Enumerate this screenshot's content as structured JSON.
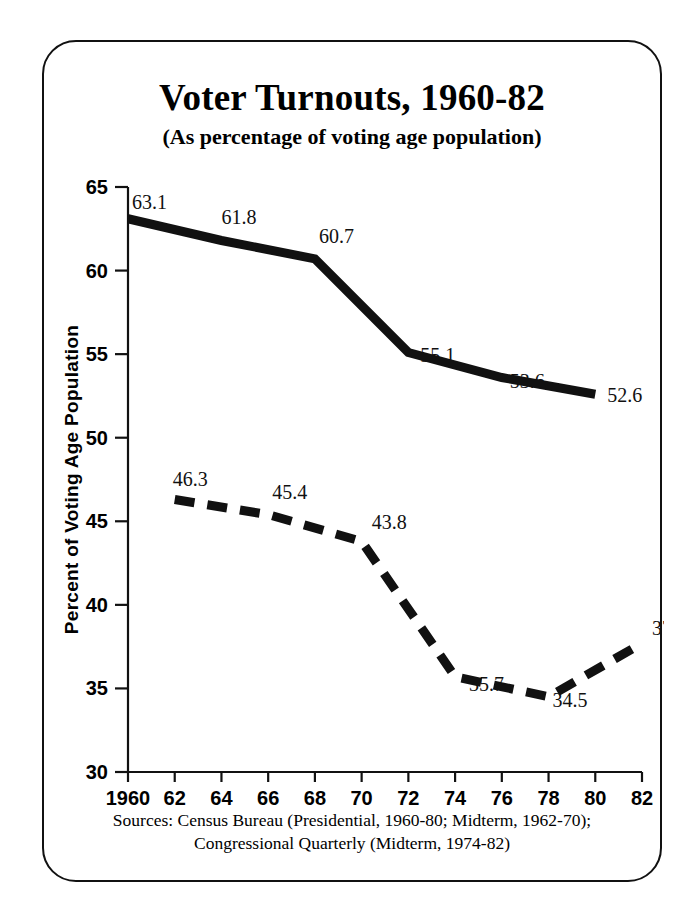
{
  "figure": {
    "title": "Voter Turnouts, 1960-82",
    "subtitle": "(As percentage of voting age population)",
    "source_line_1": "Sources: Census Bureau (Presidential, 1960-80; Midterm, 1962-70);",
    "source_line_2": "Congressional Quarterly (Midterm, 1974-82)"
  },
  "chart_data": {
    "type": "line",
    "title": "Voter Turnouts, 1960-82",
    "subtitle": "(As percentage of voting age population)",
    "xlabel": "",
    "ylabel": "Percent of Voting Age Population",
    "xlim": [
      1960,
      1982
    ],
    "ylim": [
      30,
      65
    ],
    "yticks": [
      30,
      35,
      40,
      45,
      50,
      55,
      60,
      65
    ],
    "ytick_labels": [
      "30",
      "35",
      "40",
      "45",
      "50",
      "55",
      "60",
      "65"
    ],
    "xticks": [
      1960,
      1962,
      1964,
      1966,
      1968,
      1970,
      1972,
      1974,
      1976,
      1978,
      1980,
      1982
    ],
    "xtick_labels": [
      "1960",
      "62",
      "64",
      "66",
      "68",
      "70",
      "72",
      "74",
      "76",
      "78",
      "80",
      "82"
    ],
    "grid": false,
    "legend_position": "inside-lower-left",
    "series": [
      {
        "name": "Presidential",
        "style": "solid",
        "color": "#111111",
        "x": [
          1960,
          1964,
          1968,
          1972,
          1976,
          1980
        ],
        "values": [
          63.1,
          61.8,
          60.7,
          55.1,
          53.6,
          52.6
        ],
        "labels": [
          "63.1",
          "61.8",
          "60.7",
          "55.1",
          "53.6",
          "52.6"
        ]
      },
      {
        "name": "Midterm (U.S. House)",
        "style": "dashed",
        "color": "#111111",
        "x": [
          1962,
          1966,
          1970,
          1974,
          1978,
          1982
        ],
        "values": [
          46.3,
          45.4,
          43.8,
          35.7,
          34.5,
          37.7
        ],
        "labels": [
          "46.3",
          "45.4",
          "43.8",
          "35.7",
          "34.5",
          "37.7"
        ]
      }
    ]
  },
  "legend": {
    "entries": [
      {
        "label": "Presidential"
      },
      {
        "label": "Midterm (U.S. House)"
      }
    ]
  }
}
